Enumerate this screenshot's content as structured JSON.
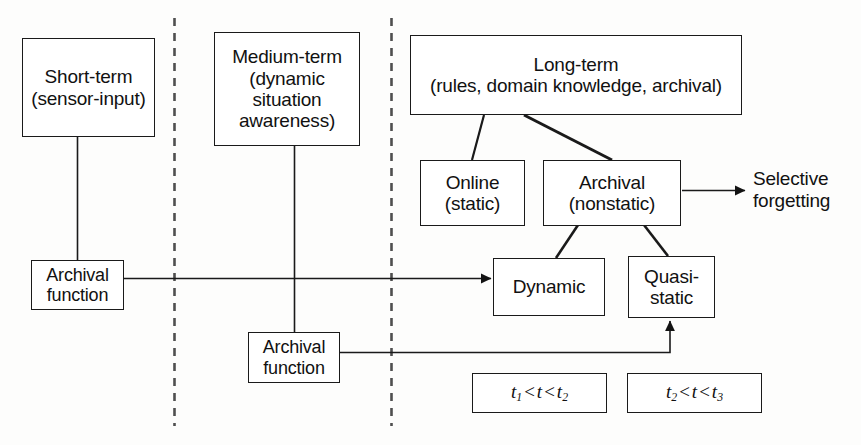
{
  "diagram": {
    "title_present": false,
    "background_color": "#fdfdfc",
    "line_color": "#1a1a1a",
    "divider_color": "#4a4a4a",
    "boxes": {
      "short_term": "Short-term\n(sensor-input)",
      "short_term_line1": "Short-term",
      "short_term_line2": "(sensor-input)",
      "medium_term_line1": "Medium-term",
      "medium_term_line2": "(dynamic",
      "medium_term_line3": "situation",
      "medium_term_line4": "awareness)",
      "long_term_line1": "Long-term",
      "long_term_line2": "(rules, domain knowledge, archival)",
      "online_line1": "Online",
      "online_line2": "(static)",
      "archival_nonstatic_line1": "Archival",
      "archival_nonstatic_line2": "(nonstatic)",
      "dynamic": "Dynamic",
      "quasi_static_line1": "Quasi-",
      "quasi_static_line2": "static",
      "archival_function_left_line1": "Archival",
      "archival_function_left_line2": "function",
      "archival_function_mid_line1": "Archival",
      "archival_function_mid_line2": "function"
    },
    "labels": {
      "selective_forgetting_line1": "Selective",
      "selective_forgetting_line2": "forgetting"
    },
    "formulas": {
      "interval_1": {
        "t_a": "t",
        "sub_a": "1",
        "op_1": "<",
        "t_mid": "t",
        "op_2": "<",
        "t_b": "t",
        "sub_b": "2",
        "plain": "t1 < t < t2"
      },
      "interval_2": {
        "t_a": "t",
        "sub_a": "2",
        "op_1": "<",
        "t_mid": "t",
        "op_2": "<",
        "t_b": "t",
        "sub_b": "3",
        "plain": "t2 < t < t3"
      }
    },
    "dividers": [
      {
        "name": "divider-short-medium",
        "x": 174
      },
      {
        "name": "divider-medium-long",
        "x": 391
      }
    ],
    "connections": [
      {
        "from": "short-term",
        "to": "archival-function-left",
        "style": "plain"
      },
      {
        "from": "medium-term",
        "to": "archival-function-mid",
        "style": "plain"
      },
      {
        "from": "archival-function-left",
        "to": "dynamic",
        "style": "arrow"
      },
      {
        "from": "archival-function-mid",
        "to": "quasi-static",
        "style": "arrow"
      },
      {
        "from": "long-term",
        "to": "online",
        "style": "plain"
      },
      {
        "from": "long-term",
        "to": "archival-nonstatic",
        "style": "plain"
      },
      {
        "from": "archival-nonstatic",
        "to": "dynamic",
        "style": "plain"
      },
      {
        "from": "archival-nonstatic",
        "to": "quasi-static",
        "style": "plain"
      },
      {
        "from": "archival-nonstatic",
        "to": "selective-forgetting",
        "style": "arrow"
      }
    ]
  }
}
